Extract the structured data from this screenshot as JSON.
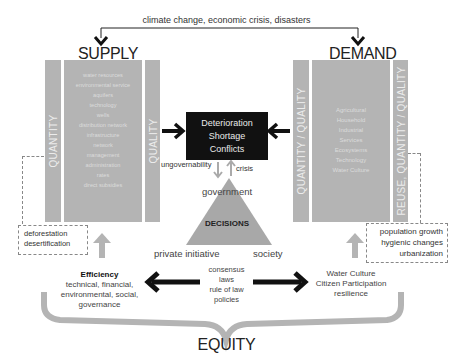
{
  "top_label": "climate change, economic crisis, disasters",
  "supply": {
    "title": "SUPPLY",
    "left_bar": "QUANTITY",
    "right_bar": "QUALITY",
    "items": [
      "water resources",
      "environmental service",
      "aquifers",
      "technology",
      "wells",
      "distribution network",
      "infrastructure",
      "network",
      "management",
      "administration",
      "rates",
      "direct subsidies"
    ],
    "pressures": [
      "deforestation",
      "desertification"
    ]
  },
  "demand": {
    "title": "DEMAND",
    "left_bar": "QUANTITY / QUALITY",
    "right_bar": "REUSE, QUANTITY / QUALITY",
    "items": [
      "Agricultural",
      "Household",
      "Industrial",
      "Services",
      "Ecosystems",
      "Technology",
      "Water Culture"
    ],
    "pressures": [
      "population growth",
      "hygienic changes",
      "urbanization"
    ]
  },
  "center": {
    "problems": [
      "Deterioration",
      "Shortage",
      "Conflicts"
    ],
    "ungovernability": "ungovernability",
    "crisis": "crisis",
    "government": "government",
    "decisions": "DECISIONS",
    "private_initiative": "private initiative",
    "society": "society",
    "instruments": [
      "consensus",
      "laws",
      "rule of law",
      "policies"
    ]
  },
  "efficiency": {
    "title": "Efficiency",
    "lines": [
      "technical, financial,",
      "environmental, social,",
      "governance"
    ]
  },
  "culture": {
    "lines": [
      "Water Culture",
      "Citizen Participation",
      "resilience"
    ]
  },
  "equity": "EQUITY"
}
